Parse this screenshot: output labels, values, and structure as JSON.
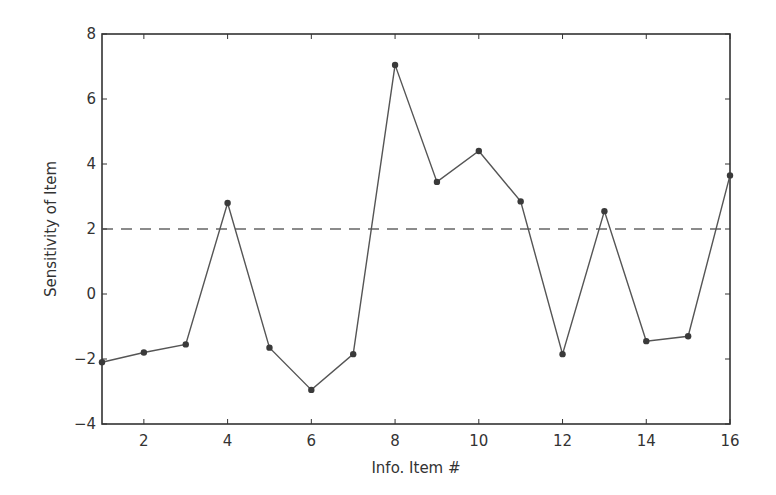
{
  "chart_data": {
    "type": "line",
    "title": "",
    "xlabel": "Info. Item #",
    "ylabel": "Sensitivity of Item",
    "x": [
      1,
      2,
      3,
      4,
      5,
      6,
      7,
      8,
      9,
      10,
      11,
      12,
      13,
      14,
      15,
      16
    ],
    "series": [
      {
        "name": "Sensitivity",
        "values": [
          -2.1,
          -1.8,
          -1.55,
          2.8,
          -1.65,
          -2.95,
          -1.85,
          7.05,
          3.45,
          4.4,
          2.85,
          -1.85,
          2.55,
          -1.45,
          -1.3,
          3.65
        ],
        "color": "#555555",
        "marker": "circle",
        "linestyle": "solid"
      }
    ],
    "reference_lines": [
      {
        "y": 2,
        "linestyle": "dashed",
        "color": "#666666"
      }
    ],
    "xlim": [
      1,
      16
    ],
    "ylim": [
      -4,
      8
    ],
    "xticks": [
      2,
      4,
      6,
      8,
      10,
      12,
      14,
      16
    ],
    "yticks": [
      -4,
      -2,
      0,
      2,
      4,
      6,
      8
    ],
    "xtick_labels": [
      "2",
      "4",
      "6",
      "8",
      "10",
      "12",
      "14",
      "16"
    ],
    "ytick_labels": [
      "−4",
      "−2",
      "0",
      "2",
      "4",
      "6",
      "8"
    ],
    "grid": false,
    "legend": null
  },
  "layout": {
    "plot_left": 102,
    "plot_right": 730,
    "plot_top": 34,
    "plot_bottom": 424
  }
}
